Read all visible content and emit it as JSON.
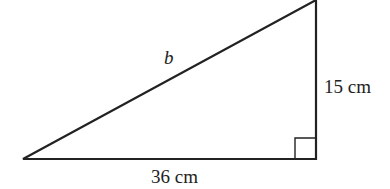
{
  "diagram": {
    "type": "right-triangle",
    "labels": {
      "hypotenuse": "b",
      "vertical_leg": "15 cm",
      "horizontal_leg": "36 cm"
    },
    "right_angle_marker": true,
    "colors": {
      "stroke": "#222222",
      "background": "#ffffff"
    }
  }
}
